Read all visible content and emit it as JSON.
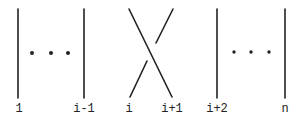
{
  "diagram": {
    "stroke_color": "#222222",
    "strands": [
      {
        "label": "1",
        "x": 18
      },
      {
        "label": "i-1",
        "x": 84
      },
      {
        "label": "i",
        "x": 130
      },
      {
        "label": "i+1",
        "x": 172
      },
      {
        "label": "i+2",
        "x": 217
      },
      {
        "label": "n",
        "x": 285
      }
    ],
    "ellipses": [
      {
        "between": [
          "1",
          "i-1"
        ],
        "text": "• • •"
      },
      {
        "between": [
          "i+2",
          "n"
        ],
        "text": "• • •"
      }
    ]
  }
}
